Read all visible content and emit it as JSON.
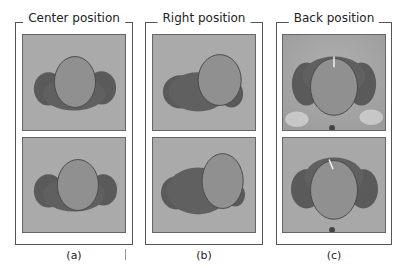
{
  "panels": [
    {
      "id": "a",
      "title": "Center position",
      "caption": "(a)",
      "head": "center"
    },
    {
      "id": "b",
      "title": "Right position",
      "caption": "(b)",
      "head": "right"
    },
    {
      "id": "c",
      "title": "Back position",
      "caption": "(c)",
      "head": "back"
    }
  ],
  "colors": {
    "background_gray": "#a9a9a9",
    "head_fill": "#8e8e8e",
    "shadow_fill": "#5c5c5c",
    "frame": "#555555"
  }
}
